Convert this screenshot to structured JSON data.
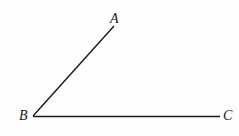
{
  "diagram": {
    "type": "angle",
    "points": [
      {
        "name": "A",
        "x": 114,
        "y": 26,
        "label_x": 110,
        "label_y": 12
      },
      {
        "name": "B",
        "x": 33,
        "y": 116,
        "label_x": 19,
        "label_y": 109
      },
      {
        "name": "C",
        "x": 220,
        "y": 116,
        "label_x": 223,
        "label_y": 109
      }
    ],
    "segments": [
      {
        "from": "B",
        "to": "A"
      },
      {
        "from": "B",
        "to": "C"
      }
    ],
    "stroke_color": "#1a1a1a",
    "labels": {
      "a": "A",
      "b": "B",
      "c": "C"
    }
  }
}
